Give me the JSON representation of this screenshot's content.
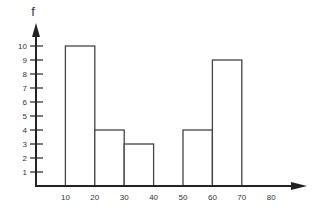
{
  "chart_data": {
    "type": "bar",
    "subtype": "histogram",
    "title": "",
    "xlabel": "",
    "ylabel": "f",
    "bins": [
      {
        "start": 10,
        "end": 20,
        "value": 10
      },
      {
        "start": 20,
        "end": 30,
        "value": 4
      },
      {
        "start": 30,
        "end": 40,
        "value": 3
      },
      {
        "start": 40,
        "end": 50,
        "value": 0
      },
      {
        "start": 50,
        "end": 60,
        "value": 4
      },
      {
        "start": 60,
        "end": 70,
        "value": 9
      }
    ],
    "categories": [
      "10-20",
      "20-30",
      "30-40",
      "40-50",
      "50-60",
      "60-70"
    ],
    "values": [
      10,
      4,
      3,
      0,
      4,
      9
    ],
    "x_ticks": [
      "10",
      "20",
      "30",
      "40",
      "50",
      "60",
      "70",
      "80"
    ],
    "y_ticks": [
      "1",
      "2",
      "3",
      "4",
      "5",
      "6",
      "7",
      "8",
      "9",
      "10"
    ],
    "xlim": [
      0,
      80
    ],
    "ylim": [
      0,
      10
    ],
    "grid": false,
    "legend": null,
    "colors": {
      "axis": "#222222",
      "bar_stroke": "#444444",
      "bar_fill": "#ffffff",
      "text": "#333333"
    }
  }
}
